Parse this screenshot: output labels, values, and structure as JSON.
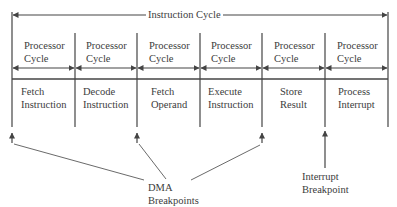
{
  "diagram": {
    "title": "Instruction Cycle",
    "processor_cycle_label": [
      "Processor",
      "Cycle"
    ],
    "stages": [
      {
        "line1": "Fetch",
        "line2": "Instruction"
      },
      {
        "line1": "Decode",
        "line2": "Instruction"
      },
      {
        "line1": "Fetch",
        "line2": "Operand"
      },
      {
        "line1": "Execute",
        "line2": "Instruction"
      },
      {
        "line1": "Store",
        "line2": "Result"
      },
      {
        "line1": "Process",
        "line2": "Interrupt"
      }
    ],
    "dma_label": {
      "line1": "DMA",
      "line2": "Breakpoints"
    },
    "interrupt_label": {
      "line1": "Interrupt",
      "line2": "Breakpoint"
    },
    "line_color": "#444444"
  }
}
